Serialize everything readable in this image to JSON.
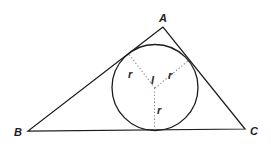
{
  "diagram": {
    "labels": {
      "vertex_a": "A",
      "vertex_b": "B",
      "vertex_c": "C",
      "incenter": "I",
      "radius_left": "r",
      "radius_right": "r",
      "radius_bottom": "r"
    },
    "colors": {
      "line": "#1c1c1c",
      "dotted_radius": "#8c8c8c",
      "background": "#ffffff"
    }
  }
}
